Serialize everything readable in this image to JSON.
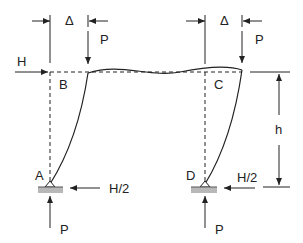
{
  "diagram": {
    "type": "portal frame sway (P-delta) diagram",
    "nodes": {
      "A": "A",
      "B": "B",
      "C": "C",
      "D": "D"
    },
    "loads": {
      "horizontal_top": "H",
      "vertical_left": "P",
      "vertical_right": "P",
      "reaction_left_horizontal": "H/2",
      "reaction_right_horizontal": "H/2",
      "reaction_left_vertical": "P",
      "reaction_right_vertical": "P"
    },
    "dimensions": {
      "sway_left": "Δ",
      "sway_right": "Δ",
      "height": "h"
    },
    "colors": {
      "line": "#222222",
      "support": "#b8b8b8",
      "background": "#ffffff"
    }
  }
}
